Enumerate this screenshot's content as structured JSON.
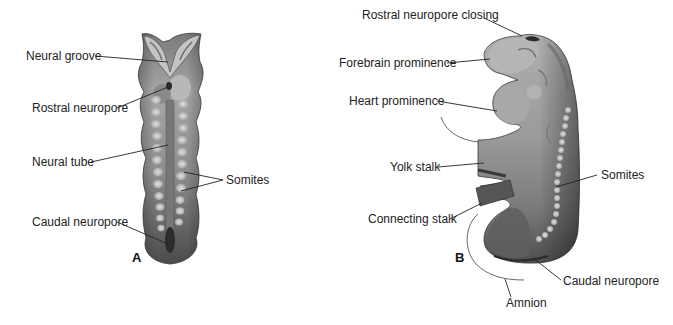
{
  "figure": {
    "panels": [
      {
        "id": "A",
        "letter": "A",
        "labels": [
          "Neural groove",
          "Rostral neuropore",
          "Neural tube",
          "Somites",
          "Caudal neuropore"
        ]
      },
      {
        "id": "B",
        "letter": "B",
        "labels": [
          "Rostral neuropore closing",
          "Forebrain prominence",
          "Heart prominence",
          "Yolk stalk",
          "Somites",
          "Connecting stalk",
          "Caudal neuropore",
          "Amnion"
        ]
      }
    ],
    "colors": {
      "tissue_light": "#b4b4b4",
      "tissue_mid": "#8c8c8c",
      "tissue_dark": "#555555",
      "somite": "#cfcfcf",
      "leader_line": "#222222",
      "text": "#222222",
      "background": "#ffffff"
    }
  }
}
